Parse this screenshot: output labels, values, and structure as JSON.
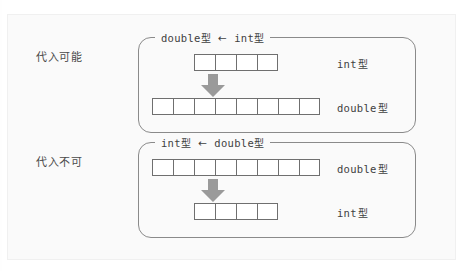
{
  "figure": {
    "side_labels": [
      {
        "id": "assignable",
        "text": "代入可能"
      },
      {
        "id": "not-assignable",
        "text": "代入不可"
      }
    ],
    "groups": [
      {
        "id": "widening",
        "title": {
          "source_type": "double",
          "source_suffix": "型",
          "arrow": "←",
          "target_type": "int",
          "target_suffix": "型"
        },
        "rows": [
          {
            "id": "int-row",
            "cells": 8,
            "label_type": "int",
            "label_suffix": "型"
          },
          {
            "id": "double-row",
            "cells": 8,
            "label_type": "double",
            "label_suffix": "型"
          }
        ],
        "arrow_icon": "down-arrow-thick"
      },
      {
        "id": "narrowing",
        "title": {
          "source_type": "int",
          "source_suffix": "型",
          "arrow": "←",
          "target_type": "double",
          "target_suffix": "型"
        },
        "rows": [
          {
            "id": "double-row",
            "cells": 8,
            "label_type": "double",
            "label_suffix": "型"
          },
          {
            "id": "int-row",
            "cells": 4,
            "label_type": "int",
            "label_suffix": "型"
          }
        ],
        "arrow_icon": "down-arrow-thick"
      }
    ],
    "cell_counts": {
      "group1_top": 4,
      "group1_bottom": 8,
      "group2_top": 8,
      "group2_bottom": 4
    },
    "colors": {
      "page_background": "#ffffff",
      "frame_background": "#fafafa",
      "box_border": "#8a8a8a",
      "cell_border": "#6f6f6f",
      "cell_fill": "#ffffff",
      "arrow_fill": "#9a9a9a",
      "text": "#3f3f3f",
      "side_label_text": "#4b4b4b"
    }
  }
}
